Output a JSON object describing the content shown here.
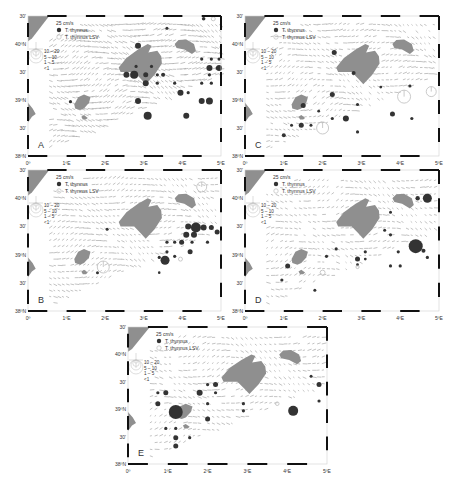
{
  "figure": {
    "width": 455,
    "height": 479,
    "colors": {
      "frame_dark": "#111111",
      "frame_light": "#ffffff",
      "land": "#8f8f8f",
      "arrow": "#9a9a9a",
      "dot": "#333333",
      "lsv_stroke": "#bdbdbd",
      "label": "#333333"
    },
    "axes": {
      "lat_labels": [
        "30'",
        "40ºN",
        "30'",
        "39ºN",
        "30'",
        "38ºN"
      ],
      "lon_labels": [
        "0º",
        "1ºE",
        "2ºE",
        "3ºE",
        "4ºE",
        "5ºE"
      ]
    },
    "legend": {
      "speed_label": "25 cm/s",
      "items": [
        {
          "symbol": "filled-circle",
          "label": "T. thynnus"
        },
        {
          "symbol": "open-circle",
          "label": "T. thynnus LSV"
        }
      ],
      "size_classes": [
        "10 – 20",
        "5 – 10",
        "1 – 5",
        "<1"
      ]
    },
    "panels": [
      {
        "id": "A",
        "letter": "A",
        "x": 28,
        "y": 16,
        "w": 193,
        "h": 140,
        "arrow_density": "high",
        "dots": [
          {
            "lon": 4.55,
            "lat": 40.45,
            "r": 1.8,
            "type": "filled"
          },
          {
            "lon": 4.8,
            "lat": 40.45,
            "r": 2,
            "type": "open"
          },
          {
            "lon": 3.6,
            "lat": 40.28,
            "r": 1.5,
            "type": "filled"
          },
          {
            "lon": 2.85,
            "lat": 39.97,
            "r": 3,
            "type": "filled"
          },
          {
            "lon": 2.8,
            "lat": 39.6,
            "r": 1.6,
            "type": "filled"
          },
          {
            "lon": 3.2,
            "lat": 39.6,
            "r": 1.6,
            "type": "filled"
          },
          {
            "lon": 2.55,
            "lat": 39.45,
            "r": 3,
            "type": "filled"
          },
          {
            "lon": 2.75,
            "lat": 39.45,
            "r": 4,
            "type": "filled"
          },
          {
            "lon": 3.05,
            "lat": 39.45,
            "r": 2.5,
            "type": "filled"
          },
          {
            "lon": 3.35,
            "lat": 39.45,
            "r": 1.6,
            "type": "filled"
          },
          {
            "lon": 3.5,
            "lat": 39.45,
            "r": 2,
            "type": "filled"
          },
          {
            "lon": 3.05,
            "lat": 39.3,
            "r": 3,
            "type": "filled"
          },
          {
            "lon": 3.35,
            "lat": 39.3,
            "r": 1.6,
            "type": "filled"
          },
          {
            "lon": 4.7,
            "lat": 39.57,
            "r": 3,
            "type": "filled"
          },
          {
            "lon": 4.95,
            "lat": 39.57,
            "r": 3,
            "type": "filled"
          },
          {
            "lon": 4.75,
            "lat": 39.73,
            "r": 1.6,
            "type": "filled"
          },
          {
            "lon": 4.95,
            "lat": 39.73,
            "r": 1.6,
            "type": "filled"
          },
          {
            "lon": 4.5,
            "lat": 39.73,
            "r": 1.6,
            "type": "filled"
          },
          {
            "lon": 4.7,
            "lat": 39.45,
            "r": 1.6,
            "type": "filled"
          },
          {
            "lon": 4.5,
            "lat": 39.3,
            "r": 1.6,
            "type": "filled"
          },
          {
            "lon": 4.75,
            "lat": 39.3,
            "r": 1.6,
            "type": "filled"
          },
          {
            "lon": 4.9,
            "lat": 39.57,
            "r": 1.6,
            "type": "filled"
          },
          {
            "lon": 3.95,
            "lat": 39.13,
            "r": 3,
            "type": "filled"
          },
          {
            "lon": 4.15,
            "lat": 39.13,
            "r": 1.6,
            "type": "filled"
          },
          {
            "lon": 3.8,
            "lat": 39.3,
            "r": 1.6,
            "type": "filled"
          },
          {
            "lon": 4.5,
            "lat": 38.98,
            "r": 3,
            "type": "filled"
          },
          {
            "lon": 4.7,
            "lat": 38.98,
            "r": 3.5,
            "type": "filled"
          },
          {
            "lon": 2.85,
            "lat": 38.98,
            "r": 3,
            "type": "filled"
          },
          {
            "lon": 1.1,
            "lat": 38.97,
            "r": 1.6,
            "type": "filled"
          },
          {
            "lon": 3.1,
            "lat": 38.72,
            "r": 4,
            "type": "filled"
          },
          {
            "lon": 4.1,
            "lat": 38.72,
            "r": 3,
            "type": "filled"
          }
        ],
        "open_big": []
      },
      {
        "id": "C",
        "letter": "C",
        "x": 245,
        "y": 16,
        "w": 194,
        "h": 140,
        "arrow_density": "medium",
        "dots": [
          {
            "lon": 2.3,
            "lat": 39.85,
            "r": 2.5,
            "type": "filled"
          },
          {
            "lon": 2.8,
            "lat": 39.48,
            "r": 2,
            "type": "filled"
          },
          {
            "lon": 3.5,
            "lat": 39.23,
            "r": 1.4,
            "type": "filled"
          },
          {
            "lon": 4.25,
            "lat": 39.25,
            "r": 1.6,
            "type": "filled"
          },
          {
            "lon": 2.25,
            "lat": 39.1,
            "r": 2.5,
            "type": "filled"
          },
          {
            "lon": 1.5,
            "lat": 38.9,
            "r": 2.5,
            "type": "filled"
          },
          {
            "lon": 2.9,
            "lat": 38.92,
            "r": 1.6,
            "type": "filled"
          },
          {
            "lon": 1.9,
            "lat": 38.8,
            "r": 1.4,
            "type": "filled"
          },
          {
            "lon": 3.8,
            "lat": 38.75,
            "r": 2.5,
            "type": "filled"
          },
          {
            "lon": 2.25,
            "lat": 38.67,
            "r": 1.6,
            "type": "filled"
          },
          {
            "lon": 2.6,
            "lat": 38.67,
            "r": 3,
            "type": "filled"
          },
          {
            "lon": 4.3,
            "lat": 38.67,
            "r": 1.6,
            "type": "filled"
          },
          {
            "lon": 1.2,
            "lat": 38.55,
            "r": 1.5,
            "type": "filled"
          },
          {
            "lon": 1.45,
            "lat": 38.55,
            "r": 2.5,
            "type": "filled"
          },
          {
            "lon": 1.7,
            "lat": 38.55,
            "r": 1.5,
            "type": "filled"
          },
          {
            "lon": 2.9,
            "lat": 38.43,
            "r": 1.6,
            "type": "filled"
          },
          {
            "lon": 1.0,
            "lat": 38.37,
            "r": 2,
            "type": "filled"
          },
          {
            "lon": 2.0,
            "lat": 38.5,
            "r": 6,
            "type": "open"
          },
          {
            "lon": 4.1,
            "lat": 39.06,
            "r": 6.5,
            "type": "open"
          },
          {
            "lon": 4.8,
            "lat": 39.15,
            "r": 5,
            "type": "open"
          }
        ]
      },
      {
        "id": "B",
        "letter": "B",
        "x": 28,
        "y": 170,
        "w": 193,
        "h": 141,
        "arrow_density": "medium",
        "dots": [
          {
            "lon": 4.5,
            "lat": 40.2,
            "r": 5,
            "type": "open"
          },
          {
            "lon": 4.35,
            "lat": 39.48,
            "r": 5,
            "type": "filled"
          },
          {
            "lon": 4.55,
            "lat": 39.48,
            "r": 3,
            "type": "filled"
          },
          {
            "lon": 4.15,
            "lat": 39.5,
            "r": 3,
            "type": "filled"
          },
          {
            "lon": 4.75,
            "lat": 39.48,
            "r": 2.5,
            "type": "filled"
          },
          {
            "lon": 4.9,
            "lat": 39.4,
            "r": 2.5,
            "type": "filled"
          },
          {
            "lon": 4.1,
            "lat": 39.35,
            "r": 3,
            "type": "filled"
          },
          {
            "lon": 4.3,
            "lat": 39.35,
            "r": 3,
            "type": "filled"
          },
          {
            "lon": 3.98,
            "lat": 39.22,
            "r": 2.5,
            "type": "filled"
          },
          {
            "lon": 4.25,
            "lat": 39.22,
            "r": 1.6,
            "type": "filled"
          },
          {
            "lon": 4.65,
            "lat": 39.22,
            "r": 1.6,
            "type": "filled"
          },
          {
            "lon": 3.6,
            "lat": 39.22,
            "r": 1.6,
            "type": "filled"
          },
          {
            "lon": 3.8,
            "lat": 39.22,
            "r": 1.6,
            "type": "filled"
          },
          {
            "lon": 4.2,
            "lat": 39.05,
            "r": 2.5,
            "type": "filled"
          },
          {
            "lon": 3.6,
            "lat": 39.05,
            "r": 1.6,
            "type": "filled"
          },
          {
            "lon": 3.8,
            "lat": 38.97,
            "r": 1.6,
            "type": "filled"
          },
          {
            "lon": 3.4,
            "lat": 38.95,
            "r": 1.6,
            "type": "filled"
          },
          {
            "lon": 3.55,
            "lat": 38.9,
            "r": 4.5,
            "type": "filled"
          },
          {
            "lon": 3.95,
            "lat": 38.92,
            "r": 2,
            "type": "open"
          },
          {
            "lon": 2.05,
            "lat": 39.45,
            "r": 1.5,
            "type": "filled"
          },
          {
            "lon": 1.8,
            "lat": 38.68,
            "r": 1.5,
            "type": "filled"
          },
          {
            "lon": 3.4,
            "lat": 38.68,
            "r": 1.3,
            "type": "filled"
          },
          {
            "lon": 1.95,
            "lat": 38.78,
            "r": 6,
            "type": "open"
          }
        ]
      },
      {
        "id": "D",
        "letter": "D",
        "x": 245,
        "y": 170,
        "w": 194,
        "h": 141,
        "arrow_density": "low",
        "dots": [
          {
            "lon": 4.7,
            "lat": 40.0,
            "r": 4.5,
            "type": "filled"
          },
          {
            "lon": 4.45,
            "lat": 40.0,
            "r": 2.2,
            "type": "filled"
          },
          {
            "lon": 3.75,
            "lat": 39.75,
            "r": 1.5,
            "type": "filled"
          },
          {
            "lon": 3.6,
            "lat": 39.43,
            "r": 1.5,
            "type": "filled"
          },
          {
            "lon": 3.75,
            "lat": 39.35,
            "r": 1.6,
            "type": "filled"
          },
          {
            "lon": 4.4,
            "lat": 39.15,
            "r": 7,
            "type": "filled"
          },
          {
            "lon": 4.6,
            "lat": 39.07,
            "r": 2,
            "type": "filled"
          },
          {
            "lon": 4.7,
            "lat": 38.95,
            "r": 1.6,
            "type": "filled"
          },
          {
            "lon": 2.35,
            "lat": 39.1,
            "r": 1.6,
            "type": "filled"
          },
          {
            "lon": 2.1,
            "lat": 38.97,
            "r": 1.6,
            "type": "filled"
          },
          {
            "lon": 2.9,
            "lat": 38.92,
            "r": 2.5,
            "type": "filled"
          },
          {
            "lon": 3.1,
            "lat": 38.92,
            "r": 1.4,
            "type": "filled"
          },
          {
            "lon": 3.1,
            "lat": 39.05,
            "r": 1.6,
            "type": "filled"
          },
          {
            "lon": 3.95,
            "lat": 39.05,
            "r": 1.6,
            "type": "filled"
          },
          {
            "lon": 4.0,
            "lat": 38.8,
            "r": 1.6,
            "type": "filled"
          },
          {
            "lon": 3.75,
            "lat": 38.8,
            "r": 1.6,
            "type": "filled"
          },
          {
            "lon": 2.9,
            "lat": 38.82,
            "r": 1.4,
            "type": "filled"
          },
          {
            "lon": 1.1,
            "lat": 38.8,
            "r": 2.5,
            "type": "filled"
          },
          {
            "lon": 0.95,
            "lat": 38.55,
            "r": 1.6,
            "type": "filled"
          },
          {
            "lon": 1.8,
            "lat": 38.37,
            "r": 1.5,
            "type": "filled"
          },
          {
            "lon": 2.0,
            "lat": 38.68,
            "r": 2.5,
            "type": "open"
          },
          {
            "lon": 2.9,
            "lat": 38.78,
            "r": 1.6,
            "type": "open"
          }
        ]
      },
      {
        "id": "E",
        "letter": "E",
        "x": 128,
        "y": 327,
        "w": 199,
        "h": 137,
        "arrow_density": "low",
        "dots": [
          {
            "lon": 4.6,
            "lat": 39.6,
            "r": 1.5,
            "type": "filled"
          },
          {
            "lon": 4.8,
            "lat": 39.45,
            "r": 2.5,
            "type": "filled"
          },
          {
            "lon": 4.8,
            "lat": 39.15,
            "r": 1.6,
            "type": "filled"
          },
          {
            "lon": 4.15,
            "lat": 38.97,
            "r": 5,
            "type": "filled"
          },
          {
            "lon": 2.2,
            "lat": 39.45,
            "r": 2.5,
            "type": "filled"
          },
          {
            "lon": 2.0,
            "lat": 39.45,
            "r": 1.6,
            "type": "filled"
          },
          {
            "lon": 1.8,
            "lat": 39.3,
            "r": 3,
            "type": "filled"
          },
          {
            "lon": 2.2,
            "lat": 39.3,
            "r": 1.6,
            "type": "filled"
          },
          {
            "lon": 0.95,
            "lat": 39.3,
            "r": 2.5,
            "type": "filled"
          },
          {
            "lon": 0.75,
            "lat": 39.3,
            "r": 1.6,
            "type": "filled"
          },
          {
            "lon": 0.75,
            "lat": 39.1,
            "r": 2.5,
            "type": "filled"
          },
          {
            "lon": 2.0,
            "lat": 39.1,
            "r": 1.6,
            "type": "filled"
          },
          {
            "lon": 2.9,
            "lat": 39.1,
            "r": 1.6,
            "type": "filled"
          },
          {
            "lon": 1.2,
            "lat": 38.95,
            "r": 7,
            "type": "filled"
          },
          {
            "lon": 2.9,
            "lat": 38.97,
            "r": 1.6,
            "type": "filled"
          },
          {
            "lon": 2.0,
            "lat": 38.82,
            "r": 2.5,
            "type": "filled"
          },
          {
            "lon": 0.95,
            "lat": 38.65,
            "r": 1.6,
            "type": "filled"
          },
          {
            "lon": 1.2,
            "lat": 38.65,
            "r": 1.6,
            "type": "filled"
          },
          {
            "lon": 1.2,
            "lat": 38.48,
            "r": 2.5,
            "type": "filled"
          },
          {
            "lon": 1.55,
            "lat": 38.48,
            "r": 1.6,
            "type": "filled"
          },
          {
            "lon": 1.2,
            "lat": 38.33,
            "r": 2.5,
            "type": "filled"
          },
          {
            "lon": 3.75,
            "lat": 39.1,
            "r": 1.8,
            "type": "open"
          }
        ]
      }
    ]
  }
}
